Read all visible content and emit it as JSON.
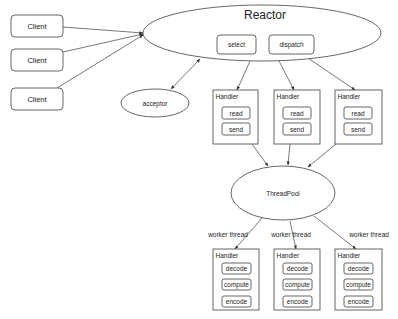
{
  "diagram": {
    "title": "Reactor",
    "reactor": {
      "label": "Reactor",
      "components": [
        "select",
        "dispatch"
      ]
    },
    "clients": [
      {
        "label": "Client"
      },
      {
        "label": "Client"
      },
      {
        "label": "Client"
      }
    ],
    "acceptor": {
      "label": "acceptor"
    },
    "io_handlers": [
      {
        "label": "Handler",
        "ops": [
          "read",
          "send"
        ]
      },
      {
        "label": "Handler",
        "ops": [
          "read",
          "send"
        ]
      },
      {
        "label": "Handler",
        "ops": [
          "read",
          "send"
        ]
      }
    ],
    "threadpool": {
      "label": "ThreadPool"
    },
    "worker_edge_label": "worker thread",
    "worker_labels": [
      "worker thread",
      "worker thread",
      "worker thread"
    ],
    "worker_handlers": [
      {
        "label": "Handler",
        "ops": [
          "decode",
          "compute",
          "encode"
        ]
      },
      {
        "label": "Handler",
        "ops": [
          "decode",
          "compute",
          "encode"
        ]
      },
      {
        "label": "Handler",
        "ops": [
          "decode",
          "compute",
          "encode"
        ]
      }
    ],
    "edges": [
      {
        "from": "client-1",
        "to": "reactor"
      },
      {
        "from": "client-2",
        "to": "reactor"
      },
      {
        "from": "client-3",
        "to": "reactor"
      },
      {
        "from": "reactor",
        "to": "acceptor",
        "bidirectional": true
      },
      {
        "from": "reactor",
        "to": "handler-1"
      },
      {
        "from": "reactor",
        "to": "handler-2"
      },
      {
        "from": "reactor",
        "to": "handler-3"
      },
      {
        "from": "handler-1",
        "to": "threadpool"
      },
      {
        "from": "handler-2",
        "to": "threadpool"
      },
      {
        "from": "handler-3",
        "to": "threadpool"
      },
      {
        "from": "threadpool",
        "to": "worker-handler-1",
        "label": "worker thread"
      },
      {
        "from": "threadpool",
        "to": "worker-handler-2",
        "label": "worker thread"
      },
      {
        "from": "threadpool",
        "to": "worker-handler-3",
        "label": "worker thread"
      }
    ],
    "colors": {
      "stroke": "#555555",
      "text": "#222222",
      "background": "#ffffff"
    }
  }
}
